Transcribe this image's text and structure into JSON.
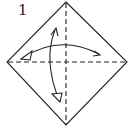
{
  "diagram": {
    "step_number": "1",
    "stroke_color": "#222222",
    "background": "#ffffff",
    "elements": [
      {
        "type": "square-paper-diamond",
        "vertices": {
          "top": [
            66,
            2
          ],
          "right": [
            127,
            62
          ],
          "bottom": [
            66,
            125
          ],
          "left": [
            7,
            62
          ]
        }
      },
      {
        "type": "valley-fold-line",
        "orientation": "vertical",
        "from": [
          66,
          2
        ],
        "to": [
          66,
          125
        ]
      },
      {
        "type": "valley-fold-line",
        "orientation": "horizontal",
        "from": [
          7,
          62
        ],
        "to": [
          127,
          62
        ]
      },
      {
        "type": "fold-unfold-arrow",
        "direction": "horizontal",
        "from": [
          100,
          55
        ],
        "to": [
          22,
          59
        ]
      },
      {
        "type": "fold-unfold-arrow",
        "direction": "vertical",
        "from": [
          56,
          28
        ],
        "to": [
          60,
          101
        ]
      }
    ]
  }
}
